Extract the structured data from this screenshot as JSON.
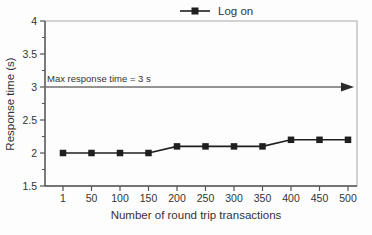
{
  "figure": {
    "legend": {
      "label": "Log on"
    }
  },
  "chart_data": {
    "type": "line",
    "x": [
      1,
      50,
      100,
      150,
      200,
      250,
      300,
      350,
      400,
      450,
      500
    ],
    "series": [
      {
        "name": "Log on",
        "values": [
          2,
          2,
          2,
          2,
          2.1,
          2.1,
          2.1,
          2.1,
          2.2,
          2.2,
          2.2
        ]
      }
    ],
    "xlabel": "Number of round trip transactions",
    "ylabel": "Response time (s)",
    "ylim": [
      1.5,
      4
    ],
    "yticks": [
      1.5,
      2,
      2.5,
      3,
      3.5,
      4
    ],
    "y_minor_step": 0.25,
    "grid": false,
    "legend_position": "top-center",
    "marker": "square",
    "annotation": {
      "text": "Max response time = 3 s",
      "y": 3,
      "arrow": "horizontal-right"
    },
    "colors": {
      "series_line": "#1f1f1f",
      "marker_fill": "#1f1f1f",
      "axis": "#555555",
      "frame": "#a8a8a8",
      "annotation_arrow": "#2a2a2a",
      "text": "#333333"
    }
  }
}
